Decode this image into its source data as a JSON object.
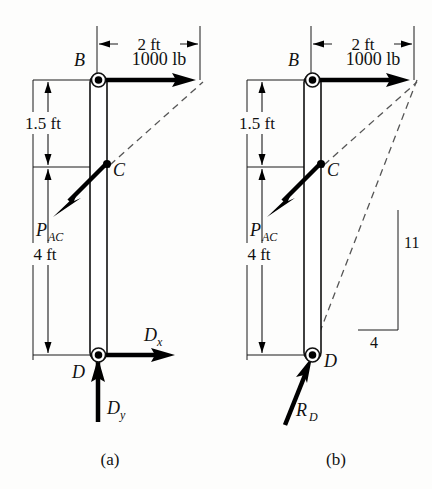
{
  "figure": {
    "type": "free-body-diagram-pair",
    "background_color": "#fdfdfc",
    "ink_color": "#111111",
    "dashed_color": "#555555"
  },
  "captions": {
    "a": "(a)",
    "b": "(b)"
  },
  "diagram_a": {
    "points": {
      "b": "B",
      "c": "C",
      "d": "D"
    },
    "dimensions": {
      "horizontal": "2 ft",
      "upper_vertical": "1.5 ft",
      "lower_vertical": "4 ft"
    },
    "forces": {
      "applied_load": "1000 lb",
      "member_force": "P",
      "member_force_sub": "AC",
      "reaction_x": "D",
      "reaction_x_sub": "x",
      "reaction_y": "D",
      "reaction_y_sub": "y"
    }
  },
  "diagram_b": {
    "points": {
      "b": "B",
      "c": "C",
      "d": "D"
    },
    "dimensions": {
      "horizontal": "2 ft",
      "upper_vertical": "1.5 ft",
      "lower_vertical": "4 ft"
    },
    "forces": {
      "applied_load": "1000 lb",
      "member_force": "P",
      "member_force_sub": "AC",
      "reaction": "R",
      "reaction_sub": "D"
    },
    "slope_triangle": {
      "vertical": "11",
      "horizontal": "4"
    }
  }
}
